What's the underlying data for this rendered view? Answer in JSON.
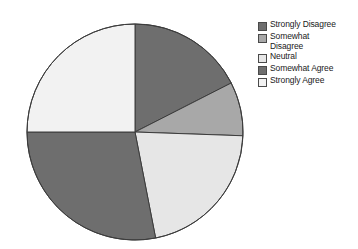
{
  "chart_data": {
    "type": "pie",
    "title": "",
    "categories": [
      "Strongly Disagree",
      "Somewhat Disagree",
      "Neutral",
      "Somewhat Agree",
      "Strongly Agree"
    ],
    "values": [
      17.5,
      8.0,
      21.5,
      28.0,
      25.0
    ],
    "units": "percent",
    "start_angle_deg": 0,
    "direction": "clockwise",
    "slice_angles_deg": [
      63,
      29,
      77,
      101,
      90
    ],
    "slice_colors": [
      "#6e6e6e",
      "#a8a8a8",
      "#e6e6e6",
      "#6e6e6e",
      "#f2f2f2"
    ],
    "outline_color": "#3c3c3c",
    "grid": false,
    "legend_position": "right",
    "xlabel": "",
    "ylabel": ""
  },
  "legend": {
    "entries": [
      {
        "label": "Strongly Disagree",
        "color": "#6e6e6e"
      },
      {
        "label": "Somewhat\nDisagree",
        "color": "#a8a8a8"
      },
      {
        "label": "Neutral",
        "color": "#e6e6e6"
      },
      {
        "label": "Somewhat Agree",
        "color": "#6e6e6e"
      },
      {
        "label": "Strongly Agree",
        "color": "#f2f2f2"
      }
    ]
  }
}
